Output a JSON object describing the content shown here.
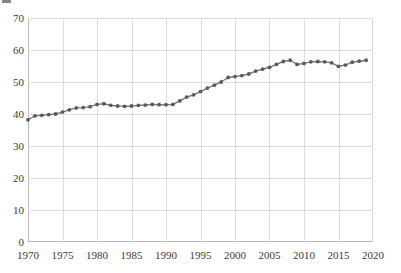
{
  "chart_data": {
    "type": "line",
    "title": "",
    "subtitle": "",
    "xlabel": "",
    "ylabel": "",
    "xlim": [
      1970,
      2020
    ],
    "ylim": [
      0,
      70
    ],
    "grid": true,
    "legend": "none",
    "marker": "circle",
    "line_color": "#777777",
    "marker_color": "#5a5a5a",
    "grid_color": "#dedee2",
    "axis_color": "#b9b9bd",
    "xticks": [
      1970,
      1975,
      1980,
      1985,
      1990,
      1995,
      2000,
      2005,
      2010,
      2015,
      2020
    ],
    "xtick_labels": [
      "1970",
      "1975",
      "1980",
      "1985",
      "1990",
      "1995",
      "2000",
      "2005",
      "2010",
      "2015",
      "2020"
    ],
    "yticks": [
      0,
      10,
      20,
      30,
      40,
      50,
      60,
      70
    ],
    "ytick_labels": [
      "0",
      "10",
      "20",
      "30",
      "40",
      "50",
      "60",
      "70"
    ],
    "series": [
      {
        "name": "value",
        "x": [
          1970,
          1971,
          1972,
          1973,
          1974,
          1975,
          1976,
          1977,
          1978,
          1979,
          1980,
          1981,
          1982,
          1983,
          1984,
          1985,
          1986,
          1987,
          1988,
          1989,
          1990,
          1991,
          1992,
          1993,
          1994,
          1995,
          1996,
          1997,
          1998,
          1999,
          2000,
          2001,
          2002,
          2003,
          2004,
          2005,
          2006,
          2007,
          2008,
          2009,
          2010,
          2011,
          2012,
          2013,
          2014,
          2015,
          2016,
          2017,
          2018,
          2019
        ],
        "values": [
          38.2,
          39.4,
          39.6,
          39.8,
          40.0,
          40.6,
          41.3,
          41.9,
          42.0,
          42.3,
          43.0,
          43.2,
          42.7,
          42.5,
          42.4,
          42.5,
          42.7,
          42.8,
          43.0,
          42.9,
          42.9,
          43.0,
          44.1,
          45.3,
          46.0,
          47.0,
          48.1,
          49.0,
          50.0,
          51.4,
          51.7,
          52.0,
          52.5,
          53.4,
          54.0,
          54.6,
          55.5,
          56.4,
          56.8,
          55.5,
          55.8,
          56.3,
          56.4,
          56.3,
          56.0,
          54.9,
          55.3,
          56.2,
          56.5,
          56.8
        ]
      }
    ]
  }
}
